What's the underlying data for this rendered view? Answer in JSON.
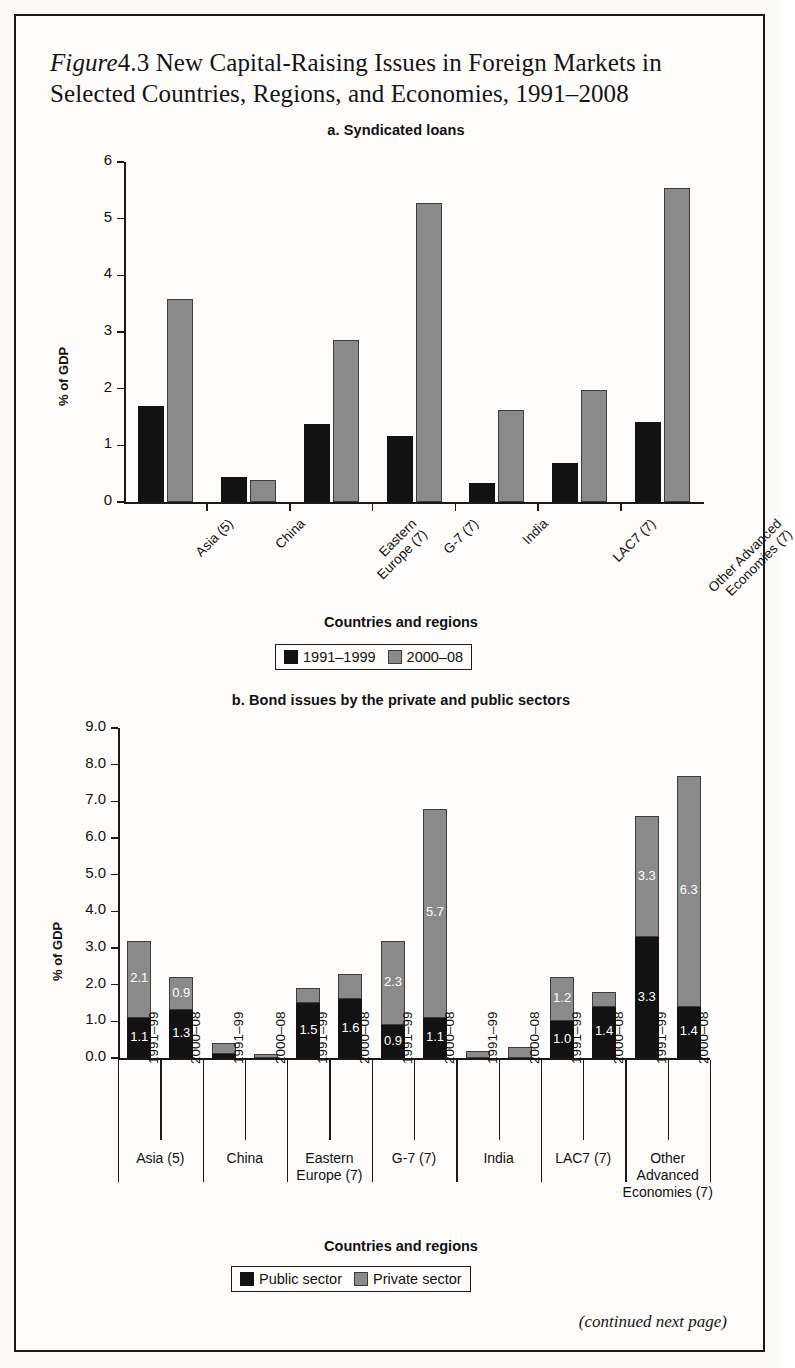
{
  "figure": {
    "label": "Figure",
    "number": "4.3",
    "title_line1": "New Capital-Raising Issues in Foreign Markets in",
    "title_line2": "Selected Countries, Regions, and Economies, 1991–2008",
    "footer": "(continued next page)"
  },
  "panel_a": {
    "title": "a. Syndicated loans",
    "ylabel": "% of GDP",
    "xaxis_title": "Countries and regions",
    "legend": [
      {
        "label": "1991–1999",
        "color": "#121212"
      },
      {
        "label": "2000–08",
        "color": "#8a8a8a"
      }
    ]
  },
  "panel_b": {
    "title": "b. Bond issues by the private and public sectors",
    "ylabel": "% of GDP",
    "xaxis_title": "Countries and regions",
    "legend": [
      {
        "label": "Public sector",
        "color": "#121212"
      },
      {
        "label": "Private sector",
        "color": "#8a8a8a"
      }
    ],
    "period_labels": [
      "1991–99",
      "2000–08"
    ]
  },
  "chart_data": [
    {
      "type": "bar",
      "title": "a. Syndicated loans",
      "xlabel": "Countries and regions",
      "ylabel": "% of GDP",
      "ylim": [
        0,
        6
      ],
      "yticks": [
        0,
        1,
        2,
        3,
        4,
        5,
        6
      ],
      "ytick_labels": [
        "0",
        "1",
        "2",
        "3",
        "4",
        "5",
        "6"
      ],
      "grid": false,
      "legend_position": "bottom",
      "categories": [
        "Asia (5)",
        "China",
        "Eastern Europe (7)",
        "G-7 (7)",
        "India",
        "LAC7 (7)",
        "Other Advanced Economies (7)"
      ],
      "category_lines": [
        [
          "Asia (5)"
        ],
        [
          "China"
        ],
        [
          "Eastern",
          "Europe (7)"
        ],
        [
          "G-7 (7)"
        ],
        [
          "India"
        ],
        [
          "LAC7 (7)"
        ],
        [
          "Other Advanced",
          "Economies (7)"
        ]
      ],
      "series": [
        {
          "name": "1991–1999",
          "color": "#121212",
          "values": [
            1.7,
            0.45,
            1.38,
            1.17,
            0.33,
            0.69,
            1.42
          ]
        },
        {
          "name": "2000–08",
          "color": "#8a8a8a",
          "values": [
            3.59,
            0.39,
            2.86,
            5.27,
            1.63,
            1.98,
            5.55
          ]
        }
      ]
    },
    {
      "type": "bar",
      "subtype": "stacked",
      "title": "b. Bond issues by the private and public sectors",
      "xlabel": "Countries and regions",
      "ylabel": "% of GDP",
      "ylim": [
        0,
        9
      ],
      "yticks": [
        0,
        1,
        2,
        3,
        4,
        5,
        6,
        7,
        8,
        9
      ],
      "ytick_labels": [
        "0.0",
        "1.0",
        "2.0",
        "3.0",
        "4.0",
        "5.0",
        "6.0",
        "7.0",
        "8.0",
        "9.0"
      ],
      "grid": false,
      "legend_position": "bottom",
      "groups": [
        {
          "name": "Asia (5)",
          "lines": [
            "Asia (5)"
          ]
        },
        {
          "name": "China",
          "lines": [
            "China"
          ]
        },
        {
          "name": "Eastern Europe (7)",
          "lines": [
            "Eastern",
            "Europe (7)"
          ]
        },
        {
          "name": "G-7 (7)",
          "lines": [
            "G-7 (7)"
          ]
        },
        {
          "name": "India",
          "lines": [
            "India"
          ]
        },
        {
          "name": "LAC7 (7)",
          "lines": [
            "LAC7 (7)"
          ]
        },
        {
          "name": "Other Advanced Economies (7)",
          "lines": [
            "Other",
            "Advanced",
            "Economies (7)"
          ]
        }
      ],
      "periods": [
        "1991–99",
        "2000–08"
      ],
      "series": [
        {
          "name": "Public sector",
          "color": "#121212"
        },
        {
          "name": "Private sector",
          "color": "#8a8a8a"
        }
      ],
      "bars": [
        {
          "group": "Asia (5)",
          "period": "1991–99",
          "public": 1.1,
          "private": 2.1,
          "public_label": "1.1",
          "private_label": "2.1",
          "total": 3.2
        },
        {
          "group": "Asia (5)",
          "period": "2000–08",
          "public": 1.3,
          "private": 0.9,
          "public_label": "1.3",
          "private_label": "0.9",
          "total": 2.2
        },
        {
          "group": "China",
          "period": "1991–99",
          "public": 0.1,
          "private": 0.3,
          "public_label": "",
          "private_label": "",
          "total": 0.4
        },
        {
          "group": "China",
          "period": "2000–08",
          "public": 0.0,
          "private": 0.1,
          "public_label": "",
          "private_label": "",
          "total": 0.1
        },
        {
          "group": "Eastern Europe (7)",
          "period": "1991–99",
          "public": 1.5,
          "private": 0.4,
          "public_label": "1.5",
          "private_label": "",
          "total": 1.9
        },
        {
          "group": "Eastern Europe (7)",
          "period": "2000–08",
          "public": 1.6,
          "private": 0.7,
          "public_label": "1.6",
          "private_label": "",
          "total": 2.3
        },
        {
          "group": "G-7 (7)",
          "period": "1991–99",
          "public": 0.9,
          "private": 2.3,
          "public_label": "0.9",
          "private_label": "2.3",
          "total": 3.2
        },
        {
          "group": "G-7 (7)",
          "period": "2000–08",
          "public": 1.1,
          "private": 5.7,
          "public_label": "1.1",
          "private_label": "5.7",
          "total": 6.8
        },
        {
          "group": "India",
          "period": "1991–99",
          "public": 0.0,
          "private": 0.2,
          "public_label": "",
          "private_label": "",
          "total": 0.2
        },
        {
          "group": "India",
          "period": "2000–08",
          "public": 0.0,
          "private": 0.3,
          "public_label": "",
          "private_label": "",
          "total": 0.3
        },
        {
          "group": "LAC7 (7)",
          "period": "1991–99",
          "public": 1.0,
          "private": 1.2,
          "public_label": "1.0",
          "private_label": "1.2",
          "total": 2.2
        },
        {
          "group": "LAC7 (7)",
          "period": "2000–08",
          "public": 1.4,
          "private": 0.4,
          "public_label": "1.4",
          "private_label": "",
          "total": 1.8
        },
        {
          "group": "Other Advanced Economies (7)",
          "period": "1991–99",
          "public": 3.3,
          "private": 3.3,
          "public_label": "3.3",
          "private_label": "3.3",
          "total": 6.6
        },
        {
          "group": "Other Advanced Economies (7)",
          "period": "2000–08",
          "public": 1.4,
          "private": 6.3,
          "public_label": "1.4",
          "private_label": "6.3",
          "total": 7.7
        }
      ]
    }
  ]
}
